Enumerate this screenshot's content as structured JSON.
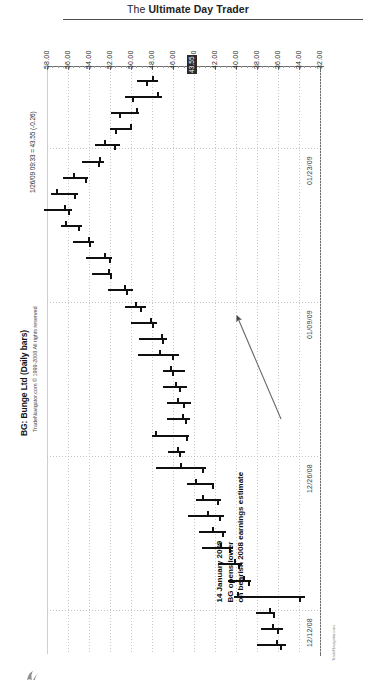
{
  "running_head": {
    "prefix": "The ",
    "bold": "Ultimate Day Trader"
  },
  "chart": {
    "title": "BG: Bunge Ltd (Daily bars)",
    "copyright": "TradeNavigator.com © 1999-2008 All rights reserved",
    "quote_line": "1/26/09 09:33 = 43.55 (-0.26)",
    "last_price_tag": "43.55",
    "watermark": "TradeNavigator.com"
  },
  "annotation": {
    "line1": "14 January 2009",
    "line2": "BG opens lower",
    "line3": "on bearish 2008 earnings estimate"
  },
  "chart_data": {
    "type": "bar",
    "title": "BG: Bunge Ltd (Daily bars)",
    "subtitle": "1/26/09 09:33 = 43.55 (-0.26)",
    "xlabel": "Date",
    "ylabel": "Price",
    "orientation": "rotated-90",
    "grid": true,
    "legend": "none",
    "ylim": [
      32.0,
      58.0
    ],
    "ytick_labels": [
      "58.00",
      "56.00",
      "54.00",
      "52.00",
      "50.00",
      "48.00",
      "46.00",
      "44.00",
      "42.00",
      "40.00",
      "38.00",
      "36.00",
      "34.00",
      "32.00"
    ],
    "ytick_values": [
      58.0,
      56.0,
      54.0,
      52.0,
      50.0,
      48.0,
      46.0,
      44.0,
      42.0,
      40.0,
      38.0,
      36.0,
      34.0,
      32.0
    ],
    "xtick_labels": [
      "01/23/09",
      "01/09/09",
      "12/26/08",
      "12/12/08"
    ],
    "last_price": 43.55,
    "last_change": -0.26,
    "series_name": "BG daily OHLC",
    "ohlc": [
      {
        "i": 0,
        "high": 49.4,
        "low": 47.4,
        "open": 48.0,
        "close": 48.6
      },
      {
        "i": 1,
        "high": 50.6,
        "low": 47.0,
        "open": 47.5,
        "close": 49.9
      },
      {
        "i": 2,
        "high": 51.9,
        "low": 49.2,
        "open": 49.5,
        "close": 51.1
      },
      {
        "i": 3,
        "high": 52.0,
        "low": 49.9,
        "open": 50.1,
        "close": 51.5
      },
      {
        "i": 4,
        "high": 53.4,
        "low": 51.0,
        "open": 52.6,
        "close": 51.6
      },
      {
        "i": 5,
        "high": 54.7,
        "low": 52.6,
        "open": 53.0,
        "close": 53.1
      },
      {
        "i": 6,
        "high": 56.5,
        "low": 54.1,
        "open": 55.5,
        "close": 54.4
      },
      {
        "i": 7,
        "high": 57.6,
        "low": 55.0,
        "open": 57.1,
        "close": 55.4
      },
      {
        "i": 8,
        "high": 58.3,
        "low": 55.6,
        "open": 56.4,
        "close": 56.0
      },
      {
        "i": 9,
        "high": 56.7,
        "low": 54.7,
        "open": 56.3,
        "close": 55.0
      },
      {
        "i": 10,
        "high": 55.5,
        "low": 53.5,
        "open": 54.1,
        "close": 54.0
      },
      {
        "i": 11,
        "high": 54.3,
        "low": 51.8,
        "open": 52.6,
        "close": 52.1
      },
      {
        "i": 12,
        "high": 53.7,
        "low": 51.8,
        "open": 52.2,
        "close": 52.0
      },
      {
        "i": 13,
        "high": 52.2,
        "low": 49.8,
        "open": 50.7,
        "close": 50.5
      },
      {
        "i": 14,
        "high": 50.6,
        "low": 48.6,
        "open": 49.6,
        "close": 49.1
      },
      {
        "i": 15,
        "high": 50.0,
        "low": 47.5,
        "open": 48.2,
        "close": 48.0
      },
      {
        "i": 16,
        "high": 49.2,
        "low": 46.6,
        "open": 47.1,
        "close": 47.0
      },
      {
        "i": 17,
        "high": 49.3,
        "low": 45.4,
        "open": 47.3,
        "close": 46.1
      },
      {
        "i": 18,
        "high": 47.0,
        "low": 44.9,
        "open": 46.3,
        "close": 46.1
      },
      {
        "i": 19,
        "high": 47.0,
        "low": 44.7,
        "open": 45.8,
        "close": 45.4
      },
      {
        "i": 20,
        "high": 46.6,
        "low": 44.3,
        "open": 45.6,
        "close": 45.0
      },
      {
        "i": 21,
        "high": 46.6,
        "low": 44.4,
        "open": 45.1,
        "close": 44.9
      },
      {
        "i": 22,
        "high": 48.0,
        "low": 44.5,
        "open": 47.7,
        "close": 44.8
      },
      {
        "i": 23,
        "high": 46.5,
        "low": 44.9,
        "open": 45.6,
        "close": 45.4
      },
      {
        "i": 24,
        "high": 47.6,
        "low": 42.9,
        "open": 45.3,
        "close": 43.2
      },
      {
        "i": 25,
        "high": 44.7,
        "low": 42.1,
        "open": 43.9,
        "close": 42.3
      },
      {
        "i": 26,
        "high": 43.8,
        "low": 41.4,
        "open": 43.2,
        "close": 41.8
      },
      {
        "i": 27,
        "high": 44.6,
        "low": 41.1,
        "open": 42.8,
        "close": 41.6
      },
      {
        "i": 28,
        "high": 43.5,
        "low": 41.0,
        "open": 42.3,
        "close": 41.3
      },
      {
        "i": 29,
        "high": 43.2,
        "low": 40.3,
        "open": 41.5,
        "close": 40.7
      },
      {
        "i": 30,
        "high": 41.7,
        "low": 39.4,
        "open": 40.2,
        "close": 39.8
      },
      {
        "i": 31,
        "high": 40.8,
        "low": 38.6,
        "open": 39.3,
        "close": 38.9
      },
      {
        "i": 32,
        "high": 40.2,
        "low": 33.4,
        "open": 39.9,
        "close": 34.0
      },
      {
        "i": 33,
        "high": 38.1,
        "low": 36.3,
        "open": 36.9,
        "close": 36.5
      },
      {
        "i": 34,
        "high": 37.6,
        "low": 35.5,
        "open": 36.6,
        "close": 36.1
      },
      {
        "i": 35,
        "high": 38.0,
        "low": 35.2,
        "open": 36.2,
        "close": 35.8
      }
    ]
  }
}
